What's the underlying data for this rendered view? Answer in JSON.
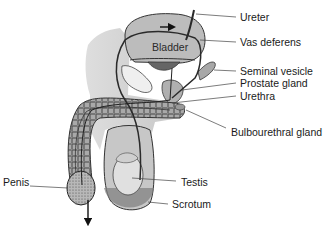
{
  "diagram": {
    "inner_labels": {
      "bladder": "Bladder"
    },
    "labels": [
      {
        "id": "ureter",
        "text": "Ureter"
      },
      {
        "id": "vas-deferens",
        "text": "Vas deferens"
      },
      {
        "id": "seminal-vesicle",
        "text": "Seminal vesicle"
      },
      {
        "id": "prostate-gland",
        "text": "Prostate gland"
      },
      {
        "id": "urethra",
        "text": "Urethra"
      },
      {
        "id": "bulbourethral-gland",
        "text": "Bulbourethral gland"
      },
      {
        "id": "penis",
        "text": "Penis"
      },
      {
        "id": "testis",
        "text": "Testis"
      },
      {
        "id": "scrotum",
        "text": "Scrotum"
      }
    ],
    "colors": {
      "background": "#ffffff",
      "tissue": "#c9c9c9",
      "tissue_dark": "#8a8a8a",
      "outline": "#3a3a3a",
      "text": "#1a1a1a"
    }
  }
}
